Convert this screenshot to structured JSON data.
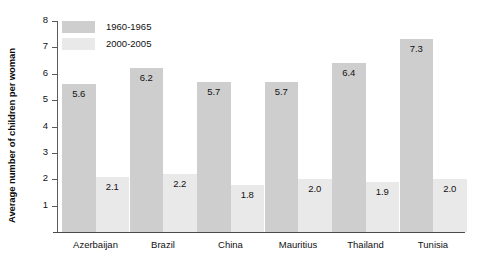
{
  "chart_data": {
    "type": "bar",
    "title": "",
    "subtitle": "",
    "xlabel": "",
    "ylabel": "Average number of children per woman",
    "ylim": [
      0,
      8
    ],
    "yticks": [
      1,
      2,
      3,
      4,
      5,
      6,
      7,
      8
    ],
    "grid": false,
    "legend_position": "top-left",
    "categories": [
      "Azerbaijan",
      "Brazil",
      "China",
      "Mauritius",
      "Thailand",
      "Tunisia"
    ],
    "series": [
      {
        "name": "1960-1965",
        "color": "#cecece",
        "values": [
          5.6,
          6.2,
          5.7,
          5.7,
          6.4,
          7.3
        ],
        "labels": [
          "5.6",
          "6.2",
          "5.7",
          "5.7",
          "6.4",
          "7.3"
        ]
      },
      {
        "name": "2000-2005",
        "color": "#e9e9e9",
        "values": [
          2.1,
          2.2,
          1.8,
          2.0,
          1.9,
          2.0
        ],
        "labels": [
          "2.1",
          "2.2",
          "1.8",
          "2.0",
          "1.9",
          "2.0"
        ]
      }
    ]
  },
  "axis": {
    "y_tick_labels": [
      "8",
      "7",
      "6",
      "5",
      "4",
      "3",
      "2",
      "1"
    ]
  },
  "legend": {
    "items": [
      {
        "label": "1960-1965"
      },
      {
        "label": "2000-2005"
      }
    ]
  }
}
